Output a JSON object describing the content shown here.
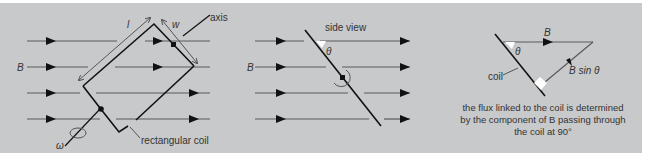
{
  "diagram": {
    "panels": [
      {
        "name": "rotating-coil",
        "labels": {
          "field": "B",
          "length": "l",
          "width": "w",
          "axis": "axis",
          "angular_velocity": "ω",
          "coil": "rectangular coil"
        }
      },
      {
        "name": "side-view",
        "labels": {
          "title": "side view",
          "field": "B",
          "angle": "θ"
        }
      },
      {
        "name": "flux-component",
        "labels": {
          "field": "B",
          "component": "B sin θ",
          "angle": "θ",
          "coil": "coil"
        },
        "caption": [
          "the flux linked to the coil is determined",
          "by the component of B passing through",
          "the coil at 90°"
        ]
      }
    ],
    "colors": {
      "background": "#c8c9ca",
      "field_line": "#555555",
      "coil": "#111111",
      "dimension": "#444444"
    }
  }
}
